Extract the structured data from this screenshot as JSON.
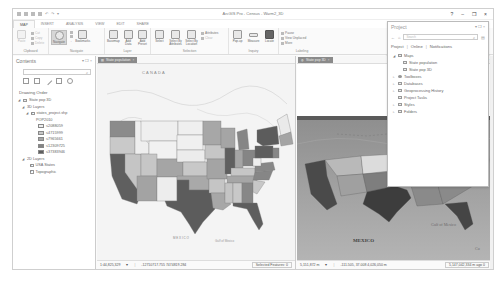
{
  "window": {
    "title": "ArcGIS Pro - Census - Warm2_3D",
    "controls": [
      "?",
      "–",
      "❐",
      "×"
    ]
  },
  "quick_access": [
    "app-menu",
    "save",
    "open",
    "undo",
    "redo",
    "more"
  ],
  "ribbon": {
    "tabs": [
      {
        "label": "PROJECT",
        "style": "project"
      },
      {
        "label": "MAP",
        "style": "active"
      },
      {
        "label": "INSERT"
      },
      {
        "label": "ANALYSIS"
      },
      {
        "label": "VIEW"
      },
      {
        "label": "EDIT"
      },
      {
        "label": "SHARE"
      }
    ],
    "groups": {
      "clipboard": {
        "label": "Clipboard",
        "paste": "Paste",
        "cut": "Cut",
        "copy": "Copy",
        "delete": "Delete"
      },
      "navigate": {
        "label": "Navigate",
        "explore": "Navigate",
        "bookmarks": "Bookmarks"
      },
      "layer": {
        "label": "Layer",
        "basemap": "Basemap",
        "add_data": "Add Data",
        "add_preset": "Add Preset"
      },
      "selection": {
        "label": "Selection",
        "select": "Select",
        "select_by_attributes": "Select By Attributes",
        "select_by_location": "Select By Location",
        "attributes": "Attributes",
        "clear": "Clear"
      },
      "inquiry": {
        "label": "Inquiry",
        "popup": "Pop-up",
        "measure": "Measure",
        "locate": "Locate"
      },
      "labeling": {
        "label": "Labeling",
        "pause": "Pause",
        "view_unplaced": "View Unplaced",
        "more": "More"
      }
    }
  },
  "contents": {
    "title": "Contents",
    "controls": "▾ ❐ ×",
    "search_placeholder": "",
    "heading": "Drawing Order",
    "items": [
      {
        "label": "State pop 3D",
        "level": 0,
        "type": "scene"
      },
      {
        "label": "3D Layers",
        "level": 1,
        "type": "group"
      },
      {
        "label": "states_project.shp",
        "level": 2,
        "type": "layer",
        "checked": true
      },
      {
        "label": "POP2010",
        "level": 3,
        "type": "field"
      }
    ],
    "legend": [
      {
        "label": "≤2088059",
        "color": "#ededed"
      },
      {
        "label": "≤4715999",
        "color": "#c8c8c8"
      },
      {
        "label": "≤7965661",
        "color": "#a6a6a6"
      },
      {
        "label": "≤12309725",
        "color": "#858585"
      },
      {
        "label": "≤37383946",
        "color": "#5f5f5f"
      }
    ],
    "layers_2d": {
      "label": "2D Layers",
      "items": [
        {
          "label": "USA States",
          "checked": true
        },
        {
          "label": "Topographic",
          "checked": true
        }
      ]
    }
  },
  "map_view_1": {
    "tab_label": "State population",
    "labels": {
      "canada": "CANADA",
      "mexico": "MEXICO",
      "gulf": "Gulf of Mexico"
    },
    "status": {
      "scale": "1:44,825,329",
      "coords": "-12710717.755  7474819.284",
      "selected": "Selected Features: 0"
    }
  },
  "map_view_2": {
    "tab_label": "State pop 3D",
    "labels": {
      "mexico": "MEXICO",
      "gulf": "Gulf of Mexico",
      "cuba": "Cu"
    },
    "status": {
      "scale": "5,151,872 m",
      "coords": "-111.505, 37.008  4,026,050 m",
      "selected": "5,147,042,334 m ago 0"
    }
  },
  "project_pane": {
    "title": "Project",
    "controls": "▾ ❐ ×",
    "search_placeholder": "Search",
    "tabs": [
      "Project",
      "Online",
      "Notifications"
    ],
    "tree": [
      {
        "label": "Maps",
        "level": 0,
        "expanded": true
      },
      {
        "label": "State population",
        "level": 1
      },
      {
        "label": "State pop 3D",
        "level": 1
      },
      {
        "label": "Toolboxes",
        "level": 0
      },
      {
        "label": "Databases",
        "level": 0
      },
      {
        "label": "Geoprocessing History",
        "level": 0
      },
      {
        "label": "Project Tasks",
        "level": 0
      },
      {
        "label": "Styles",
        "level": 0
      },
      {
        "label": "Folders",
        "level": 0
      }
    ]
  },
  "colors": {
    "project_tab": "#9a9a9a",
    "view_tab": "#8a8a8a",
    "map_bg": "#f3f3f3",
    "terrain": "#9b9b9b"
  }
}
